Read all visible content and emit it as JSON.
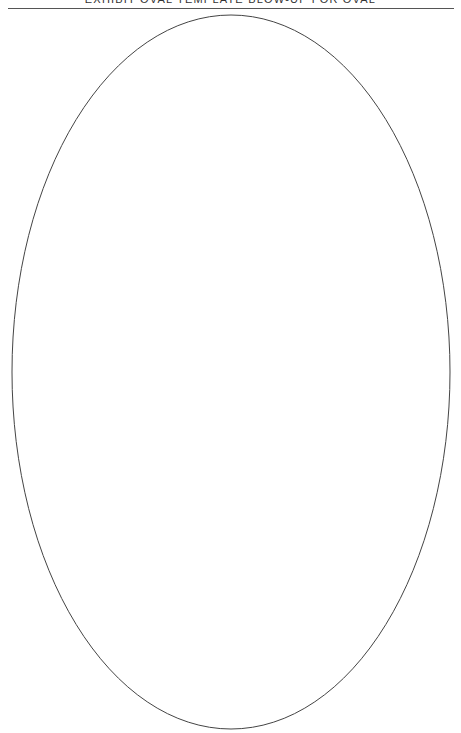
{
  "page": {
    "header_text": "EXHIBIT OVAL TEMPLATE BLOW-UP FOR OVAL",
    "header_text_note_visible": "clipped at top edge",
    "colors": {
      "background": "#ffffff",
      "rule": "#555555",
      "oval_stroke": "#444444",
      "text": "#333333"
    }
  },
  "oval": {
    "shape": "ellipse",
    "cx": 231,
    "cy": 372,
    "rx": 219,
    "ry": 357,
    "stroke_width": 1
  }
}
